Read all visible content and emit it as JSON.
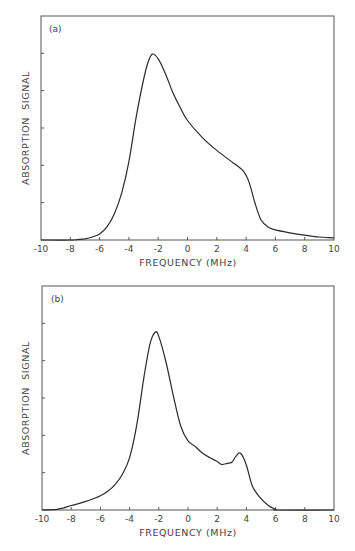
{
  "chart_data": [
    {
      "type": "line",
      "panel_label": "(a)",
      "title": "",
      "xlabel": "FREQUENCY (MHz)",
      "ylabel": "ABSORPTION  SIGNAL",
      "xlim": [
        -10,
        10
      ],
      "ylim": [
        0,
        6
      ],
      "xticks": [
        -10,
        -8,
        -6,
        -4,
        -2,
        0,
        2,
        4,
        6,
        8,
        10
      ],
      "xtick_labels": [
        "-10",
        "-8",
        "-6",
        "-4",
        "-2",
        "0",
        "2",
        "4",
        "6",
        "8",
        "10"
      ],
      "yticks": [
        1,
        2,
        3,
        4,
        5
      ],
      "ytick_labels": [],
      "grid": false,
      "legend": null,
      "series": [
        {
          "name": "absorption",
          "x": [
            -10,
            -8,
            -7.5,
            -7,
            -6.5,
            -6,
            -5.5,
            -5,
            -4.5,
            -4,
            -3.5,
            -3,
            -2.7,
            -2.4,
            -2,
            -1.5,
            -1,
            -0.5,
            0,
            1,
            2,
            3,
            3.8,
            4.2,
            4.6,
            5,
            5.5,
            6,
            7,
            8,
            9,
            10
          ],
          "y": [
            0,
            0,
            0.01,
            0.03,
            0.08,
            0.16,
            0.35,
            0.7,
            1.25,
            2.1,
            3.3,
            4.3,
            4.75,
            4.98,
            4.85,
            4.45,
            3.95,
            3.55,
            3.2,
            2.75,
            2.4,
            2.1,
            1.85,
            1.55,
            1.0,
            0.55,
            0.35,
            0.27,
            0.19,
            0.13,
            0.08,
            0.06
          ]
        }
      ]
    },
    {
      "type": "line",
      "panel_label": "(b)",
      "title": "",
      "xlabel": "FREQUENCY (MHz)",
      "ylabel": "ABSORPTION  SIGNAL",
      "xlim": [
        -10,
        10
      ],
      "ylim": [
        0,
        6
      ],
      "xticks": [
        -10,
        -8,
        -6,
        -4,
        -2,
        0,
        2,
        4,
        6,
        8,
        10
      ],
      "xtick_labels": [
        "-10",
        "-8",
        "-6",
        "-4",
        "-2",
        "0",
        "2",
        "4",
        "6",
        "8",
        "10"
      ],
      "yticks": [
        1,
        2,
        3,
        4,
        5
      ],
      "ytick_labels": [],
      "grid": false,
      "legend": null,
      "series": [
        {
          "name": "absorption",
          "x": [
            -10,
            -9,
            -8.5,
            -8,
            -7.5,
            -7,
            -6.5,
            -6,
            -5.5,
            -5,
            -4.5,
            -4,
            -3.5,
            -3,
            -2.6,
            -2.25,
            -2,
            -1.5,
            -1,
            -0.5,
            0,
            0.5,
            1,
            1.5,
            2,
            2.3,
            2.7,
            3.0,
            3.3,
            3.6,
            4.0,
            4.4,
            4.9,
            5.5,
            6,
            6.2,
            10
          ],
          "y": [
            0,
            0.02,
            0.06,
            0.12,
            0.17,
            0.23,
            0.3,
            0.38,
            0.5,
            0.68,
            0.95,
            1.4,
            2.3,
            3.6,
            4.45,
            4.76,
            4.65,
            3.95,
            3.05,
            2.25,
            1.85,
            1.7,
            1.52,
            1.4,
            1.3,
            1.22,
            1.25,
            1.28,
            1.45,
            1.52,
            1.2,
            0.65,
            0.35,
            0.12,
            0.02,
            0,
            0
          ]
        }
      ]
    }
  ]
}
